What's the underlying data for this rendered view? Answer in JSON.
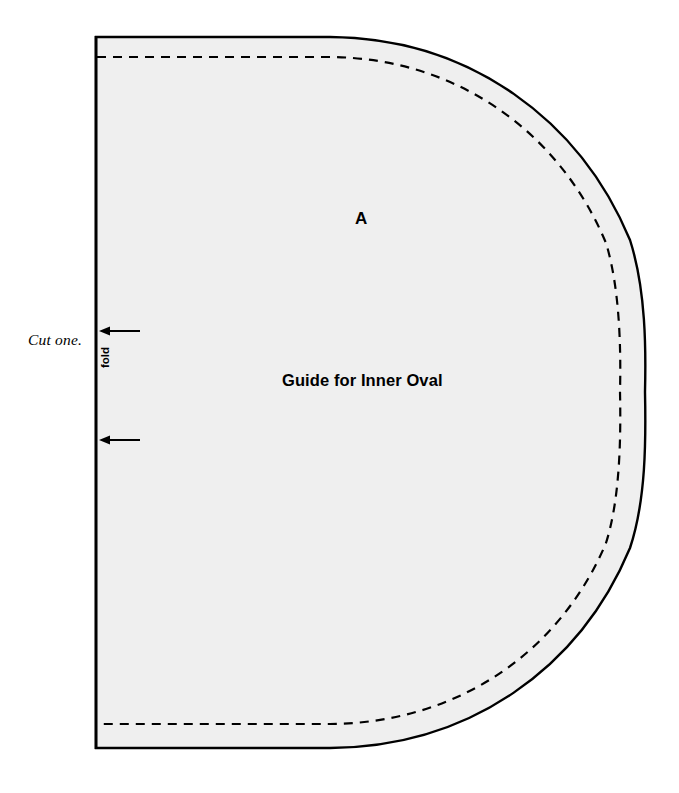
{
  "document": {
    "type": "sewing-pattern-piece",
    "background_color": "#ffffff"
  },
  "pattern": {
    "piece_letter": "A",
    "title": "Guide for Inner Oval",
    "cut_instruction": "Cut one.",
    "fold_label": "fold",
    "fill_color": "#efefef",
    "outline_color": "#000000",
    "stitch_line_color": "#000000",
    "outline_width_px": 2.4,
    "stitch_dash": "9 7",
    "geometry": {
      "fold_x": 96,
      "top_y": 37,
      "bottom_y": 748,
      "right_x": 645,
      "straight_top_end_x": 330,
      "straight_bottom_end_x": 330,
      "stitch_inset_px": 21,
      "stitch_top_y": 57,
      "stitch_bottom_y": 724,
      "stitch_right_x": 620
    },
    "fold_arrows": [
      {
        "name": "upper-fold-arrow",
        "x_tail": 140,
        "x_head": 100,
        "y": 331
      },
      {
        "name": "lower-fold-arrow",
        "x_tail": 140,
        "x_head": 100,
        "y": 440
      }
    ]
  }
}
